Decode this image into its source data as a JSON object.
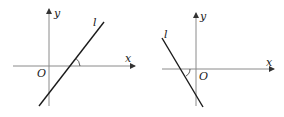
{
  "figures": [
    {
      "name": "left-graph",
      "description": "Line l with positive slope; inclination angle is acute",
      "labels": {
        "y_axis": "y",
        "x_axis": "x",
        "origin": "O",
        "line": "l"
      }
    },
    {
      "name": "right-graph",
      "description": "Line l with negative slope; inclination angle is obtuse",
      "labels": {
        "y_axis": "y",
        "x_axis": "x",
        "origin": "O",
        "line": "l"
      }
    }
  ],
  "colors": {
    "axis": "#8a8a8a",
    "line": "#1a1a1a",
    "text": "#222222"
  }
}
